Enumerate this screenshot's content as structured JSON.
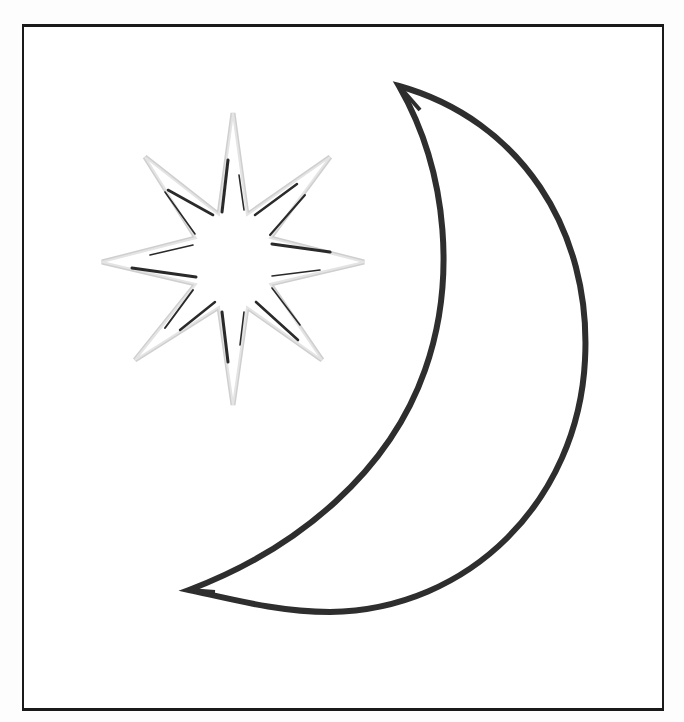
{
  "illustration": {
    "subject": "star and crescent moon",
    "frame": {
      "stroke": "#1a1a1a"
    },
    "star": {
      "name": "eight-pointed star",
      "points": 8,
      "outline_color": "#c8c8c8",
      "accent_color": "#2a2a2a",
      "center": [
        233,
        262
      ]
    },
    "moon": {
      "name": "crescent moon",
      "stroke_color": "#2e2e2e",
      "fill": "#ffffff"
    }
  }
}
